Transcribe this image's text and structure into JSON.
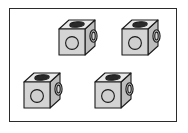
{
  "figure": {
    "title": "Isometric cube components",
    "canvas": {
      "width": 188,
      "height": 133,
      "background": "#ffffff"
    },
    "frame": {
      "label": "diagram-frame",
      "x": 9,
      "y": 8,
      "width": 168,
      "height": 114,
      "border_color": "#2b2b2b",
      "border_width": 1.2,
      "fill": "#ffffff"
    },
    "style": {
      "outline_color": "#1a1a1a",
      "front_face_fill": "#d4d4d4",
      "top_face_fill": "#e8e8e8",
      "side_face_fill": "#bdbdbd",
      "slot_fill": "#2a2a2a",
      "hole_fill": "#cfcfcf",
      "ring_fill": "#c4c4c4"
    },
    "cubes": [
      {
        "id": "cube-top-left",
        "label": "Cube 1",
        "x": 57,
        "y": 17,
        "features": [
          "top-slot",
          "front-hole",
          "right-ring"
        ]
      },
      {
        "id": "cube-top-right",
        "label": "Cube 2",
        "x": 120,
        "y": 17,
        "features": [
          "top-slot",
          "front-hole",
          "right-ring"
        ]
      },
      {
        "id": "cube-bottom-left",
        "label": "Cube 3",
        "x": 22,
        "y": 70,
        "features": [
          "top-slot",
          "front-hole",
          "right-ring"
        ]
      },
      {
        "id": "cube-bottom-right",
        "label": "Cube 4",
        "x": 93,
        "y": 70,
        "features": [
          "top-slot",
          "front-hole",
          "right-ring"
        ]
      }
    ]
  }
}
